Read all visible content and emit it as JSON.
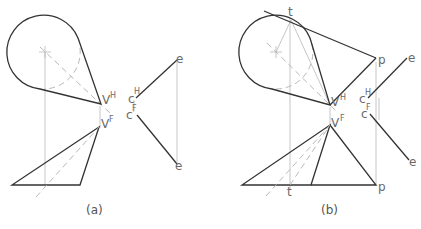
{
  "figure": {
    "panel_a": {
      "caption": "(a)",
      "labels": {
        "vertex_top": "V",
        "vertex_top_sup": "H",
        "vertex_front": "V",
        "vertex_front_sup": "F",
        "c_top": "c",
        "c_top_sup": "H",
        "c_front": "c",
        "c_front_sup": "F",
        "e_top": "e",
        "e_bottom": "e"
      }
    },
    "panel_b": {
      "caption": "(b)",
      "labels": {
        "tangent_top": "t",
        "tangent_bottom": "t",
        "p_top": "p",
        "p_bottom": "p",
        "vertex_top": "V",
        "vertex_top_sup": "H",
        "vertex_front": "V",
        "vertex_front_sup": "F",
        "c_top": "c",
        "c_top_sup": "H",
        "c_front": "c",
        "c_front_sup": "F",
        "e_top": "e",
        "e_bottom": "e"
      }
    },
    "colors": {
      "object_line": "#333333",
      "construction_line": "#b8b8b8",
      "label": "#6a6a6a"
    }
  }
}
